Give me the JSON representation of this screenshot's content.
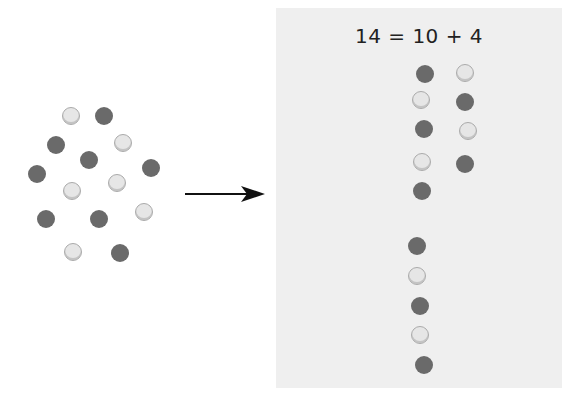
{
  "equation": "14 = 10 + 4",
  "colors": {
    "dark": "#6a6a6a",
    "light": "#e6e6e6",
    "panel": "#efefef"
  },
  "left_cluster": {
    "count": 14,
    "dots": [
      {
        "x": 71,
        "y": 116,
        "type": "light"
      },
      {
        "x": 104,
        "y": 116,
        "type": "dark"
      },
      {
        "x": 56,
        "y": 145,
        "type": "dark"
      },
      {
        "x": 123,
        "y": 143,
        "type": "light"
      },
      {
        "x": 89,
        "y": 160,
        "type": "dark"
      },
      {
        "x": 37,
        "y": 174,
        "type": "dark"
      },
      {
        "x": 151,
        "y": 168,
        "type": "dark"
      },
      {
        "x": 72,
        "y": 191,
        "type": "light"
      },
      {
        "x": 117,
        "y": 183,
        "type": "light"
      },
      {
        "x": 46,
        "y": 219,
        "type": "dark"
      },
      {
        "x": 99,
        "y": 219,
        "type": "dark"
      },
      {
        "x": 144,
        "y": 212,
        "type": "light"
      },
      {
        "x": 73,
        "y": 252,
        "type": "light"
      },
      {
        "x": 120,
        "y": 253,
        "type": "dark"
      }
    ]
  },
  "right_group_ten": [
    {
      "x": 425,
      "y": 74,
      "type": "dark"
    },
    {
      "x": 465,
      "y": 73,
      "type": "light"
    },
    {
      "x": 421,
      "y": 100,
      "type": "light"
    },
    {
      "x": 465,
      "y": 102,
      "type": "dark"
    },
    {
      "x": 424,
      "y": 129,
      "type": "dark"
    },
    {
      "x": 468,
      "y": 131,
      "type": "light"
    },
    {
      "x": 422,
      "y": 162,
      "type": "light"
    },
    {
      "x": 465,
      "y": 164,
      "type": "dark"
    },
    {
      "x": 422,
      "y": 191,
      "type": "dark"
    }
  ],
  "right_group_four": [
    {
      "x": 417,
      "y": 246,
      "type": "dark"
    },
    {
      "x": 417,
      "y": 276,
      "type": "light"
    },
    {
      "x": 420,
      "y": 306,
      "type": "dark"
    },
    {
      "x": 420,
      "y": 335,
      "type": "light"
    },
    {
      "x": 424,
      "y": 365,
      "type": "dark"
    }
  ]
}
